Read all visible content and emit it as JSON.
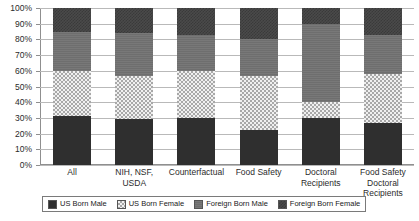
{
  "chart_data": {
    "type": "bar",
    "stacked": true,
    "stack_mode": "percent",
    "title": "",
    "subtitle": "",
    "xlabel": "",
    "ylabel": "",
    "ylim": [
      0,
      100
    ],
    "yticks": [
      0,
      10,
      20,
      30,
      40,
      50,
      60,
      70,
      80,
      90,
      100
    ],
    "ytick_labels": [
      "0%",
      "10%",
      "20%",
      "30%",
      "40%",
      "50%",
      "60%",
      "70%",
      "80%",
      "90%",
      "100%"
    ],
    "grid": true,
    "grid_axis": "y",
    "legend_position": "bottom",
    "categories": [
      "All",
      "NIH, NSF, USDA",
      "Counterfactual",
      "Food Safety",
      "Doctoral Recipients",
      "Food Safety Doctoral Recipients"
    ],
    "series": [
      {
        "name": "US Born Male",
        "values": [
          31,
          29,
          30,
          22,
          30,
          27
        ]
      },
      {
        "name": "US Born Female",
        "values": [
          29,
          28,
          30,
          35,
          10,
          31
        ]
      },
      {
        "name": "Foreign Born Male",
        "values": [
          25,
          27,
          23,
          23,
          50,
          25
        ]
      },
      {
        "name": "Foreign Born Female",
        "values": [
          15,
          16,
          17,
          20,
          10,
          17
        ]
      }
    ]
  },
  "axis": {
    "y_labels": [
      "100%",
      "90%",
      "80%",
      "70%",
      "60%",
      "50%",
      "40%",
      "30%",
      "20%",
      "10%",
      "0%"
    ],
    "x_labels": [
      "All",
      "NIH, NSF, USDA",
      "Counterfactual",
      "Food Safety",
      "Doctoral Recipients",
      "Food Safety Doctoral Recipients"
    ]
  },
  "legend": {
    "items": [
      {
        "label": "US Born Male",
        "pattern": "solid-dark-swatch"
      },
      {
        "label": "US Born Female",
        "pattern": "checker-light-swatch"
      },
      {
        "label": "Foreign Born Male",
        "pattern": "solid-gray-swatch"
      },
      {
        "label": "Foreign Born Female",
        "pattern": "speckle-dark-swatch"
      }
    ]
  },
  "colors": {
    "us_born_male": "#2f2f2f",
    "us_born_female": "#f0f0f0",
    "foreign_born_male": "#6e6e6e",
    "foreign_born_female": "#4a4a4a",
    "gridline": "#b9b9b9",
    "axis": "#8f8f8f",
    "background": "#ffffff"
  }
}
